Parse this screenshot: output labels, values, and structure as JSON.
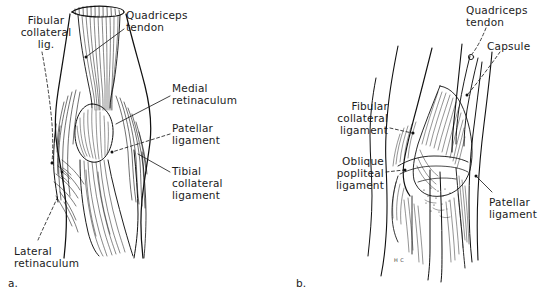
{
  "figure": {
    "background_color": "#ffffff",
    "ink_color": "#111111",
    "width": 550,
    "height": 296
  },
  "panels": [
    {
      "id": "a",
      "caption": "a.",
      "view": "anterior view of right knee showing quadriceps tendon, patellar ligament and retinacula",
      "labels": [
        {
          "name": "fibular-collateral-ligament",
          "lines": [
            "Fibular",
            "collateral",
            "lig."
          ],
          "align": "center",
          "x": 4,
          "y": 14,
          "w": 84,
          "leader": "dashed"
        },
        {
          "name": "quadriceps-tendon",
          "lines": [
            "Quadriceps",
            "tendon"
          ],
          "align": "left",
          "x": 126,
          "y": 9,
          "w": 96,
          "leader": "solid"
        },
        {
          "name": "medial-retinaculum",
          "lines": [
            "Medial",
            "retinaculum"
          ],
          "align": "left",
          "x": 172,
          "y": 82,
          "w": 92,
          "leader": "solid"
        },
        {
          "name": "patellar-ligament",
          "lines": [
            "Patellar",
            "ligament"
          ],
          "align": "left",
          "x": 172,
          "y": 122,
          "w": 92,
          "leader": "dashed"
        },
        {
          "name": "tibial-collateral-ligament",
          "lines": [
            "Tibial",
            "collateral",
            "ligament"
          ],
          "align": "left",
          "x": 172,
          "y": 165,
          "w": 92,
          "leader": "solid"
        },
        {
          "name": "lateral-retinaculum",
          "lines": [
            "Lateral",
            "retinaculum"
          ],
          "align": "left",
          "x": 14,
          "y": 245,
          "w": 100,
          "leader": "dashed"
        }
      ]
    },
    {
      "id": "b",
      "caption": "b.",
      "view": "posterolateral view of right knee showing capsule, oblique popliteal ligament and patellar ligament",
      "labels": [
        {
          "name": "quadriceps-tendon",
          "lines": [
            "Quadriceps",
            "tendon"
          ],
          "align": "left",
          "x": 466,
          "y": 4,
          "w": 84,
          "leader": "dashed"
        },
        {
          "name": "capsule",
          "lines": [
            "Capsule"
          ],
          "align": "left",
          "x": 487,
          "y": 40,
          "w": 60,
          "leader": "dashed"
        },
        {
          "name": "fibular-collateral-ligament",
          "lines": [
            "Fibular",
            "collateral",
            "ligament"
          ],
          "align": "right",
          "x": 306,
          "y": 100,
          "w": 82,
          "leader": "dashed"
        },
        {
          "name": "oblique-popliteal-ligament",
          "lines": [
            "Oblique",
            "popliteal",
            "ligament"
          ],
          "align": "right",
          "x": 300,
          "y": 155,
          "w": 84,
          "leader": "dashed"
        },
        {
          "name": "patellar-ligament",
          "lines": [
            "Patellar",
            "ligament"
          ],
          "align": "left",
          "x": 488,
          "y": 196,
          "w": 62,
          "leader": "solid"
        }
      ],
      "signature": "H C"
    }
  ]
}
